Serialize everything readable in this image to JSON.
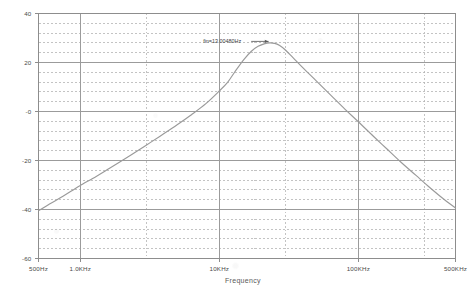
{
  "chart_data": {
    "type": "line",
    "title": "",
    "subtitle": "",
    "xlabel": "Frequency",
    "ylabel": "",
    "xscale": "log",
    "xlim": [
      500,
      500000
    ],
    "ylim": [
      -60,
      40
    ],
    "grid": true,
    "legend": null,
    "y_major_step": 20,
    "y_minor_step": 4,
    "y_ticks": [
      40,
      20,
      0,
      -20,
      -40,
      -60
    ],
    "y_tick_labels": [
      "40",
      "20",
      "-0",
      "-20",
      "-40",
      "-60"
    ],
    "x_ticks": [
      500,
      1000,
      10000,
      100000,
      500000
    ],
    "x_tick_labels": [
      "500Hz",
      "1.0KHz",
      "10KHz",
      "100KHz",
      "500KHz"
    ],
    "x_minor_gridlines": [
      3000,
      30000,
      300000
    ],
    "units": "dB",
    "annotations": [
      {
        "text": "fin=13.00480Hz",
        "x": 13000,
        "y": 28,
        "pointer": "arrow-to-peak"
      }
    ],
    "series": [
      {
        "name": "V(out) magnitude",
        "color": "#9a9a9a",
        "points": [
          {
            "x": 500,
            "y": -40.5
          },
          {
            "x": 600,
            "y": -37.8
          },
          {
            "x": 750,
            "y": -34.6
          },
          {
            "x": 900,
            "y": -31.8
          },
          {
            "x": 1000,
            "y": -30.2
          },
          {
            "x": 1300,
            "y": -26.5
          },
          {
            "x": 1600,
            "y": -23.4
          },
          {
            "x": 2000,
            "y": -20.0
          },
          {
            "x": 2600,
            "y": -15.9
          },
          {
            "x": 3200,
            "y": -12.6
          },
          {
            "x": 4000,
            "y": -9.0
          },
          {
            "x": 5000,
            "y": -5.3
          },
          {
            "x": 6300,
            "y": -1.3
          },
          {
            "x": 8000,
            "y": 3.2
          },
          {
            "x": 10000,
            "y": 8.4
          },
          {
            "x": 11500,
            "y": 12.0
          },
          {
            "x": 13000,
            "y": 16.4
          },
          {
            "x": 15000,
            "y": 21.2
          },
          {
            "x": 17000,
            "y": 24.6
          },
          {
            "x": 19000,
            "y": 26.6
          },
          {
            "x": 21000,
            "y": 27.6
          },
          {
            "x": 23000,
            "y": 28.0
          },
          {
            "x": 25000,
            "y": 27.8
          },
          {
            "x": 27000,
            "y": 27.0
          },
          {
            "x": 30000,
            "y": 25.0
          },
          {
            "x": 34000,
            "y": 21.9
          },
          {
            "x": 40000,
            "y": 17.8
          },
          {
            "x": 50000,
            "y": 12.4
          },
          {
            "x": 63000,
            "y": 6.8
          },
          {
            "x": 80000,
            "y": 1.0
          },
          {
            "x": 100000,
            "y": -4.2
          },
          {
            "x": 130000,
            "y": -10.4
          },
          {
            "x": 160000,
            "y": -15.2
          },
          {
            "x": 200000,
            "y": -20.4
          },
          {
            "x": 260000,
            "y": -26.1
          },
          {
            "x": 320000,
            "y": -30.6
          },
          {
            "x": 400000,
            "y": -35.2
          },
          {
            "x": 500000,
            "y": -39.4
          }
        ]
      }
    ],
    "peak": {
      "x": 23000,
      "y": 28.0
    }
  },
  "colors": {
    "frame": "#8d8d8d",
    "major_grid": "#9b9b9b",
    "minor_grid": "#b4b4b4",
    "curve": "#9a9a9a",
    "text": "#4a4a4a",
    "background": "#ffffff"
  }
}
